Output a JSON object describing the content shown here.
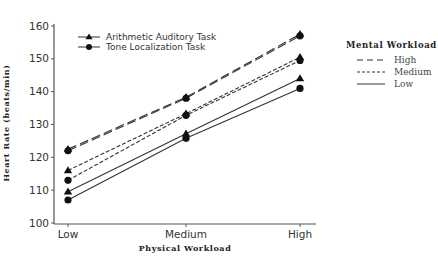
{
  "chart_data": {
    "type": "line",
    "title": "",
    "xlabel": "Physical Workload",
    "ylabel": "Heart Rate (beats/min)",
    "categories": [
      "Low",
      "Medium",
      "High"
    ],
    "ylim": [
      100,
      160
    ],
    "yticks": [
      100,
      110,
      120,
      130,
      140,
      150,
      160
    ],
    "grid": false,
    "series": [
      {
        "name": "Arithmetic Auditory Task - High",
        "task": "Arithmetic Auditory Task",
        "mental_workload": "High",
        "marker": "triangle",
        "dash": "high",
        "values": [
          122.5,
          138.3,
          157.5
        ]
      },
      {
        "name": "Tone Localization Task - High",
        "task": "Tone Localization Task",
        "mental_workload": "High",
        "marker": "circle",
        "dash": "high",
        "values": [
          122.0,
          138.0,
          157.0
        ]
      },
      {
        "name": "Arithmetic Auditory Task - Medium",
        "task": "Arithmetic Auditory Task",
        "mental_workload": "Medium",
        "marker": "triangle",
        "dash": "medium",
        "values": [
          116.0,
          133.3,
          150.5
        ]
      },
      {
        "name": "Tone Localization Task - Medium",
        "task": "Tone Localization Task",
        "mental_workload": "Medium",
        "marker": "circle",
        "dash": "medium",
        "values": [
          113.0,
          132.8,
          149.5
        ]
      },
      {
        "name": "Arithmetic Auditory Task - Low",
        "task": "Arithmetic Auditory Task",
        "mental_workload": "Low",
        "marker": "triangle",
        "dash": "low",
        "values": [
          109.5,
          127.2,
          144.0
        ]
      },
      {
        "name": "Tone Localization Task - Low",
        "task": "Tone Localization Task",
        "mental_workload": "Low",
        "marker": "circle",
        "dash": "low",
        "values": [
          107.0,
          125.8,
          141.0
        ]
      }
    ],
    "legend_task": {
      "position": "upper-left-inside",
      "entries": [
        {
          "label": "Arithmetic Auditory Task",
          "marker": "triangle"
        },
        {
          "label": "Tone Localization Task",
          "marker": "circle"
        }
      ]
    },
    "legend_mental": {
      "position": "right-outside",
      "title": "Mental Workload",
      "entries": [
        {
          "label": "High",
          "dash": "high"
        },
        {
          "label": "Medium",
          "dash": "medium"
        },
        {
          "label": "Low",
          "dash": "low"
        }
      ]
    }
  },
  "style": {
    "line_color": "#333333",
    "marker_color": "#111111",
    "axis_color": "#555555"
  }
}
